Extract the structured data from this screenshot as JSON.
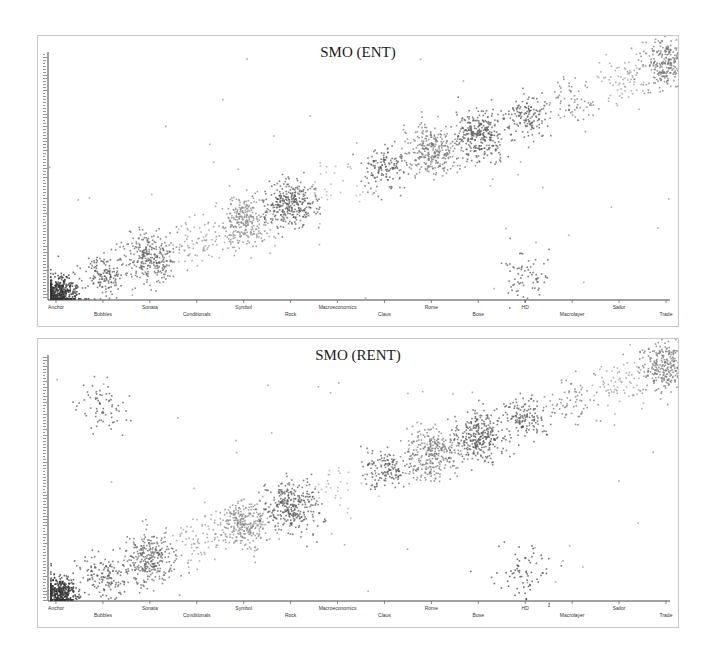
{
  "chart_data": [
    {
      "type": "scatter",
      "title": "SMO (ENT)",
      "xlabel": "",
      "ylabel": "",
      "grid": false,
      "legend": null,
      "categories": [
        "Anchor",
        "Bubbles",
        "Sonata",
        "Conditionals",
        "Symbol",
        "Rock",
        "Macroeconomics",
        "Claus",
        "Rome",
        "Bose",
        "HD",
        "Macrolayer",
        "Sailor",
        "Trade"
      ],
      "clusters": [
        {
          "category": "Anchor",
          "x": 0,
          "y": 0,
          "density": "very-high",
          "color": "#333333"
        },
        {
          "category": "Bubbles",
          "x": 1,
          "y": 1,
          "density": "medium",
          "color": "#555555"
        },
        {
          "category": "Sonata",
          "x": 2,
          "y": 2,
          "density": "high",
          "color": "#666666"
        },
        {
          "category": "Conditionals",
          "x": 3,
          "y": 3,
          "density": "low",
          "color": "#999999"
        },
        {
          "category": "Symbol",
          "x": 4,
          "y": 4,
          "density": "high",
          "color": "#888888"
        },
        {
          "category": "Rock",
          "x": 5,
          "y": 5,
          "density": "high",
          "color": "#555555"
        },
        {
          "category": "Macroeconomics",
          "x": 6,
          "y": 6,
          "density": "very-low",
          "color": "#aaaaaa"
        },
        {
          "category": "Claus",
          "x": 7,
          "y": 7,
          "density": "medium",
          "color": "#555555"
        },
        {
          "category": "Rome",
          "x": 8,
          "y": 8,
          "density": "high",
          "color": "#777777"
        },
        {
          "category": "Bose",
          "x": 9,
          "y": 9,
          "density": "high",
          "color": "#555555"
        },
        {
          "category": "HD",
          "x": 10,
          "y": 10,
          "density": "medium",
          "color": "#555555"
        },
        {
          "category": "HD (secondary)",
          "x": 10,
          "y": 1,
          "density": "low",
          "color": "#555555"
        },
        {
          "category": "Macrolayer",
          "x": 11,
          "y": 11,
          "density": "low",
          "color": "#777777"
        },
        {
          "category": "Sailor",
          "x": 12,
          "y": 12,
          "density": "low",
          "color": "#999999"
        },
        {
          "category": "Trade",
          "x": 13,
          "y": 13,
          "density": "high",
          "color": "#777777"
        }
      ],
      "xlim": [
        0,
        13
      ],
      "ylim": [
        0,
        13
      ]
    },
    {
      "type": "scatter",
      "title": "SMO (RENT)",
      "xlabel": "",
      "ylabel": "",
      "grid": false,
      "legend": null,
      "categories": [
        "Anchor",
        "Bubbles",
        "Sonata",
        "Conditionals",
        "Symbol",
        "Rock",
        "Macroeconomics",
        "Claus",
        "Rome",
        "Bose",
        "HD",
        "Macrolayer",
        "Sailor",
        "Trade"
      ],
      "clusters": [
        {
          "category": "Anchor",
          "x": 0,
          "y": 0,
          "density": "very-high",
          "color": "#333333"
        },
        {
          "category": "Bubbles",
          "x": 1,
          "y": 1,
          "density": "medium",
          "color": "#555555"
        },
        {
          "category": "Bubbles (secondary)",
          "x": 1,
          "y": 10.5,
          "density": "low",
          "color": "#555555"
        },
        {
          "category": "Sonata",
          "x": 2,
          "y": 2,
          "density": "high",
          "color": "#666666"
        },
        {
          "category": "Conditionals",
          "x": 3,
          "y": 3,
          "density": "low",
          "color": "#999999"
        },
        {
          "category": "Symbol",
          "x": 4,
          "y": 4,
          "density": "high",
          "color": "#888888"
        },
        {
          "category": "Rock",
          "x": 5,
          "y": 5,
          "density": "high",
          "color": "#555555"
        },
        {
          "category": "Macroeconomics",
          "x": 6,
          "y": 6,
          "density": "very-low",
          "color": "#aaaaaa"
        },
        {
          "category": "Claus",
          "x": 7,
          "y": 7,
          "density": "medium",
          "color": "#555555"
        },
        {
          "category": "Rome",
          "x": 8,
          "y": 8,
          "density": "high",
          "color": "#777777"
        },
        {
          "category": "Bose",
          "x": 9,
          "y": 9,
          "density": "high",
          "color": "#555555"
        },
        {
          "category": "HD",
          "x": 10,
          "y": 10,
          "density": "medium",
          "color": "#555555"
        },
        {
          "category": "HD (secondary)",
          "x": 10,
          "y": 1,
          "density": "low",
          "color": "#444444"
        },
        {
          "category": "Macrolayer",
          "x": 11,
          "y": 11,
          "density": "low",
          "color": "#777777"
        },
        {
          "category": "Sailor",
          "x": 12,
          "y": 12,
          "density": "low",
          "color": "#999999"
        },
        {
          "category": "Trade",
          "x": 13,
          "y": 13,
          "density": "high",
          "color": "#777777"
        }
      ],
      "xlim": [
        0,
        13
      ],
      "ylim": [
        0,
        13
      ]
    }
  ],
  "panels": [
    {
      "title": "SMO (ENT)",
      "xlabels": [
        "Anchor",
        "Bubbles",
        "Sonata",
        "Conditionals",
        "Symbol",
        "Rock",
        "Macroeconomics",
        "Claus",
        "Rome",
        "Bose",
        "HD",
        "Macrolayer",
        "Sailor",
        "Trade"
      ]
    },
    {
      "title": "SMO (RENT)",
      "xlabels": [
        "Anchor",
        "Bubbles",
        "Sonata",
        "Conditionals",
        "Symbol",
        "Rock",
        "Macroeconomics",
        "Claus",
        "Rome",
        "Bose",
        "HD",
        "Macrolayer",
        "Sailor",
        "Trade"
      ]
    }
  ]
}
